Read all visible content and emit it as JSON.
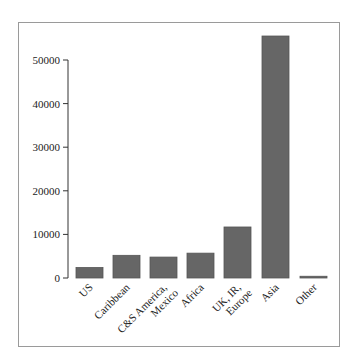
{
  "chart_data": {
    "type": "bar",
    "title": "",
    "xlabel": "",
    "ylabel": "",
    "categories": [
      "US",
      "Caribbean",
      "C&S America, Mexico",
      "Africa",
      "UK, IR, Europe",
      "Asia",
      "Other"
    ],
    "category_lines": [
      [
        "US"
      ],
      [
        "Caribbean"
      ],
      [
        "C&S America,",
        "Mexico"
      ],
      [
        "Africa"
      ],
      [
        "UK, IR,",
        "Europe"
      ],
      [
        "Asia"
      ],
      [
        "Other"
      ]
    ],
    "values": [
      2400,
      5200,
      4800,
      5700,
      11700,
      55500,
      400
    ],
    "ylim": [
      0,
      55500
    ],
    "yticks": [
      0,
      10000,
      20000,
      30000,
      40000,
      50000
    ],
    "ytick_labels": [
      "0",
      "10000",
      "20000",
      "30000",
      "40000",
      "50000"
    ],
    "grid": false,
    "legend": null,
    "bar_color": "#666666"
  }
}
